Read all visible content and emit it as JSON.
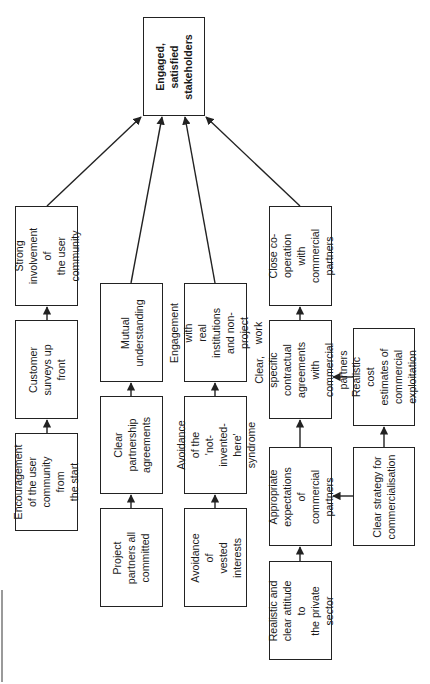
{
  "diagram": {
    "orientation": "rotated 90deg counter-clockwise",
    "goal": {
      "id": "goal",
      "label": "Engaged,\nsatisfied\nstakeholders",
      "x": 143,
      "y": 17,
      "w": 62,
      "h": 99
    },
    "nodes": [
      {
        "id": "strong_involvement",
        "label": "Strong\ninvolvement of\nthe user\ncommunity",
        "x": 15,
        "y": 206,
        "w": 63,
        "h": 100
      },
      {
        "id": "customer_surveys",
        "label": "Customer\nsurveys up\nfront",
        "x": 15,
        "y": 320,
        "w": 63,
        "h": 99
      },
      {
        "id": "encouragement",
        "label": "Encouragement\nof the user\ncommunity from\nthe start",
        "x": 15,
        "y": 433,
        "w": 63,
        "h": 98
      },
      {
        "id": "mutual_understanding",
        "label": "Mutual\nunderstanding",
        "x": 100,
        "y": 283,
        "w": 63,
        "h": 99
      },
      {
        "id": "clear_partnership",
        "label": "Clear\npartnership\nagreements",
        "x": 100,
        "y": 396,
        "w": 63,
        "h": 98
      },
      {
        "id": "project_partners",
        "label": "Project\npartners all\ncommitted",
        "x": 100,
        "y": 508,
        "w": 63,
        "h": 99
      },
      {
        "id": "engagement_real",
        "label": "Engagement with\nreal institutions\nand non-project\nwork",
        "x": 184,
        "y": 283,
        "w": 63,
        "h": 99
      },
      {
        "id": "avoid_nih",
        "label": "Avoidance of the\n'not-invented-\nhere' syndrome",
        "x": 184,
        "y": 396,
        "w": 63,
        "h": 98
      },
      {
        "id": "avoid_vested",
        "label": "Avoidance of\nvested\ninterests",
        "x": 184,
        "y": 508,
        "w": 63,
        "h": 99
      },
      {
        "id": "close_coop",
        "label": "Close co-\noperation with\ncommercial\npartners",
        "x": 269,
        "y": 206,
        "w": 63,
        "h": 100
      },
      {
        "id": "clear_specific",
        "label": "Clear, specific\ncontractual\nagreements with\ncommercial partners",
        "x": 269,
        "y": 320,
        "w": 63,
        "h": 99
      },
      {
        "id": "appropriate_expectations",
        "label": "Appropriate\nexpectations of\ncommercial\npartners",
        "x": 269,
        "y": 447,
        "w": 63,
        "h": 99
      },
      {
        "id": "realistic_attitude",
        "label": "Realistic and\nclear attitude to\nthe private sector",
        "x": 269,
        "y": 561,
        "w": 63,
        "h": 99
      },
      {
        "id": "realistic_cost",
        "label": "Realistic cost\nestimates of\ncommercial\nexploitation",
        "x": 353,
        "y": 328,
        "w": 62,
        "h": 98
      },
      {
        "id": "clear_strategy",
        "label": "Clear strategy for\ncommercialisation",
        "x": 353,
        "y": 447,
        "w": 62,
        "h": 99
      }
    ],
    "edges": [
      {
        "from": "strong_involvement",
        "to": "goal",
        "x1": 47,
        "y1": 206,
        "x2": 141,
        "y2": 117
      },
      {
        "from": "mutual_understanding",
        "to": "goal",
        "x1": 131,
        "y1": 283,
        "x2": 162,
        "y2": 117
      },
      {
        "from": "engagement_real",
        "to": "goal",
        "x1": 215,
        "y1": 283,
        "x2": 185,
        "y2": 117
      },
      {
        "from": "close_coop",
        "to": "goal",
        "x1": 300,
        "y1": 206,
        "x2": 206,
        "y2": 117
      },
      {
        "from": "customer_surveys",
        "to": "strong_involvement",
        "x1": 47,
        "y1": 320,
        "x2": 47,
        "y2": 307
      },
      {
        "from": "encouragement",
        "to": "customer_surveys",
        "x1": 47,
        "y1": 433,
        "x2": 47,
        "y2": 420
      },
      {
        "from": "clear_partnership",
        "to": "mutual_understanding",
        "x1": 131,
        "y1": 396,
        "x2": 131,
        "y2": 383
      },
      {
        "from": "project_partners",
        "to": "clear_partnership",
        "x1": 131,
        "y1": 508,
        "x2": 131,
        "y2": 495
      },
      {
        "from": "avoid_nih",
        "to": "engagement_real",
        "x1": 215,
        "y1": 396,
        "x2": 215,
        "y2": 383
      },
      {
        "from": "avoid_vested",
        "to": "avoid_nih",
        "x1": 215,
        "y1": 508,
        "x2": 215,
        "y2": 495
      },
      {
        "from": "clear_specific",
        "to": "close_coop",
        "x1": 300,
        "y1": 320,
        "x2": 300,
        "y2": 307
      },
      {
        "from": "appropriate_expectations",
        "to": "clear_specific",
        "x1": 300,
        "y1": 447,
        "x2": 300,
        "y2": 420
      },
      {
        "from": "realistic_attitude",
        "to": "appropriate_expectations",
        "x1": 300,
        "y1": 561,
        "x2": 300,
        "y2": 547
      },
      {
        "from": "realistic_cost",
        "to": "clear_specific",
        "x1": 353,
        "y1": 377,
        "x2": 333,
        "y2": 377
      },
      {
        "from": "clear_strategy",
        "to": "appropriate_expectations",
        "x1": 353,
        "y1": 496,
        "x2": 333,
        "y2": 496
      },
      {
        "from": "clear_strategy",
        "to": "realistic_cost",
        "x1": 384,
        "y1": 447,
        "x2": 384,
        "y2": 427
      }
    ],
    "colors": {
      "stroke": "#222222",
      "background": "#ffffff",
      "edge_mark": "#9a9a9a"
    }
  }
}
